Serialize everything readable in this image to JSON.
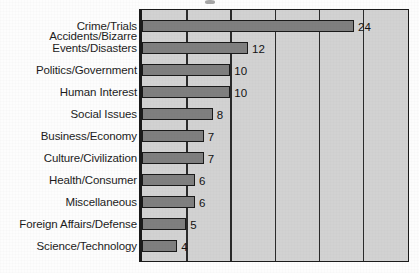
{
  "chart_data": {
    "type": "bar",
    "orientation": "horizontal",
    "title": "",
    "subtitle": "",
    "xlabel": "",
    "ylabel": "",
    "categories": [
      "Crime/Trials",
      "Accidents/Bizarre\nEvents/Disasters",
      "Politics/Government",
      "Human Interest",
      "Social Issues",
      "Business/Economy",
      "Culture/Civilization",
      "Health/Consumer",
      "Miscellaneous",
      "Foreign Affairs/Defense",
      "Science/Technology"
    ],
    "values": [
      24,
      12,
      10,
      10,
      8,
      7,
      7,
      6,
      6,
      5,
      4
    ],
    "value_labels": [
      "24",
      "12",
      "10",
      "10",
      "8",
      "7",
      "7",
      "6",
      "6",
      "5",
      "4"
    ],
    "xlim": [
      0,
      30
    ],
    "gridlines": [
      5,
      10,
      15,
      20,
      25
    ],
    "grid": true,
    "legend": "none",
    "tick_labels_x": [],
    "bar_color": "#7f7f7f",
    "bar_edge_color": "#1a1a1a",
    "plot_background": "#d2d2d2",
    "axis_color": "#1a1a1a",
    "text_color": "#1c1c1c"
  }
}
